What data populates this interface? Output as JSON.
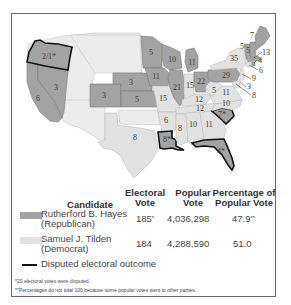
{
  "map": {
    "title": "Election of 1876",
    "colors": {
      "republican": "#a3a3a3",
      "democrat": "#e2e2e2",
      "disputed_outline": "#111111",
      "border": "#6a6a6a",
      "unassigned": "#ececec"
    },
    "state_labels": [
      {
        "state": "Oregon",
        "value": "2/1*",
        "party": "republican",
        "disputed": true
      },
      {
        "state": "California",
        "value": "6",
        "party": "republican"
      },
      {
        "state": "Nevada",
        "value": "3",
        "party": "republican"
      },
      {
        "state": "Colorado",
        "value": "3",
        "party": "republican"
      },
      {
        "state": "Nebraska",
        "value": "3",
        "party": "republican"
      },
      {
        "state": "Kansas",
        "value": "5",
        "party": "republican"
      },
      {
        "state": "Texas",
        "value": "8",
        "party": "democrat"
      },
      {
        "state": "Minnesota",
        "value": "5",
        "party": "republican"
      },
      {
        "state": "Iowa",
        "value": "11",
        "party": "republican"
      },
      {
        "state": "Missouri",
        "value": "15",
        "party": "democrat"
      },
      {
        "state": "Wisconsin",
        "value": "10",
        "party": "republican"
      },
      {
        "state": "Illinois",
        "value": "21",
        "party": "republican"
      },
      {
        "state": "Michigan",
        "value": "11",
        "party": "republican"
      },
      {
        "state": "Indiana",
        "value": "15",
        "party": "democrat"
      },
      {
        "state": "Ohio",
        "value": "22",
        "party": "republican"
      },
      {
        "state": "Kentucky",
        "value": "12",
        "party": "democrat"
      },
      {
        "state": "Tennessee",
        "value": "12",
        "party": "democrat"
      },
      {
        "state": "Arkansas",
        "value": "6",
        "party": "democrat"
      },
      {
        "state": "Louisiana",
        "value": "8*",
        "party": "republican",
        "disputed": true
      },
      {
        "state": "Mississippi",
        "value": "8",
        "party": "democrat"
      },
      {
        "state": "Alabama",
        "value": "10",
        "party": "democrat"
      },
      {
        "state": "Georgia",
        "value": "11",
        "party": "democrat"
      },
      {
        "state": "South Carolina",
        "value": "7*",
        "party": "republican",
        "disputed": true
      },
      {
        "state": "Florida",
        "value": "4*",
        "party": "republican",
        "disputed": true
      },
      {
        "state": "North Carolina",
        "value": "10",
        "party": "democrat"
      },
      {
        "state": "Virginia",
        "value": "11",
        "party": "democrat"
      },
      {
        "state": "West Virginia",
        "value": "5",
        "party": "democrat"
      },
      {
        "state": "Pennsylvania",
        "value": "29",
        "party": "republican"
      },
      {
        "state": "New York",
        "value": "35",
        "party": "democrat"
      },
      {
        "state": "Vermont",
        "value": "5",
        "party": "republican"
      },
      {
        "state": "New Hampshire",
        "value": "5",
        "party": "republican"
      },
      {
        "state": "Maine",
        "value": "7",
        "party": "republican"
      },
      {
        "state": "Massachusetts",
        "value": "13",
        "party": "republican"
      },
      {
        "state": "Rhode Island",
        "value": "4",
        "party": "republican"
      },
      {
        "state": "Connecticut",
        "value": "6",
        "party": "democrat"
      },
      {
        "state": "New Jersey",
        "value": "9",
        "party": "democrat"
      },
      {
        "state": "Delaware",
        "value": "3",
        "party": "democrat"
      },
      {
        "state": "Maryland",
        "value": "8",
        "party": "democrat"
      }
    ]
  },
  "table": {
    "headers": {
      "candidate": "Candidate",
      "electoral_1": "Electoral",
      "electoral_2": "Vote",
      "popular_1": "Popular",
      "popular_2": "Vote",
      "percent_1": "Percentage of",
      "percent_2": "Popular Vote"
    },
    "rows": [
      {
        "name": "Rutherford B. Hayes",
        "party": "(Republican)",
        "electoral": "185",
        "electoral_mark": "*",
        "popular": "4,036,298",
        "percent": "47.9",
        "percent_mark": "**",
        "color": "#a3a3a3"
      },
      {
        "name": "Samuel J. Tilden",
        "party": "(Democrat)",
        "electoral": "184",
        "electoral_mark": "",
        "popular": "4,288,590",
        "percent": "51.0",
        "percent_mark": "",
        "color": "#e2e2e2"
      }
    ],
    "legend_disputed": "Disputed electoral outcome"
  },
  "footnotes": [
    "*20 electoral votes were disputed.",
    "**Percentages do not total 100 because some popular votes went to other parties."
  ]
}
